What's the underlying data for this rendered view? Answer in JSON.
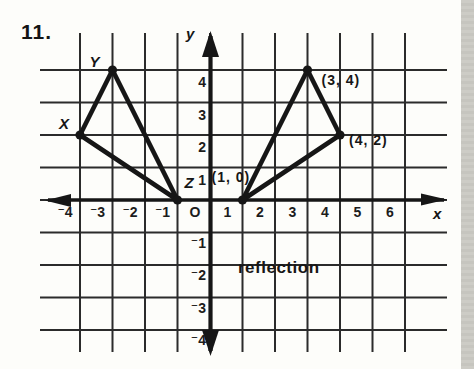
{
  "problem_number": "11.",
  "figure": {
    "x_axis_label": "x",
    "y_axis_label": "y",
    "annotation": "reflection",
    "x_ticks": [
      {
        "value": -4,
        "label": "⁻4"
      },
      {
        "value": -3,
        "label": "⁻3"
      },
      {
        "value": -2,
        "label": "⁻2"
      },
      {
        "value": -1,
        "label": "⁻1"
      },
      {
        "value": 0,
        "label": "O"
      },
      {
        "value": 1,
        "label": "1"
      },
      {
        "value": 2,
        "label": "2"
      },
      {
        "value": 3,
        "label": "3"
      },
      {
        "value": 4,
        "label": "4"
      },
      {
        "value": 5,
        "label": "5"
      },
      {
        "value": 6,
        "label": "6"
      }
    ],
    "y_ticks": [
      {
        "value": 4,
        "label": "4"
      },
      {
        "value": 3,
        "label": "3"
      },
      {
        "value": 2,
        "label": "2"
      },
      {
        "value": 1,
        "label": "1"
      },
      {
        "value": -1,
        "label": "⁻1"
      },
      {
        "value": -2,
        "label": "⁻2"
      },
      {
        "value": -3,
        "label": "⁻3"
      },
      {
        "value": -4,
        "label": "⁻4"
      }
    ]
  },
  "chart_data": {
    "type": "scatter",
    "xlim": [
      -4,
      6
    ],
    "ylim": [
      -4,
      4
    ],
    "grid": true,
    "annotation": "reflection",
    "series": [
      {
        "name": "triangle-xyz",
        "points": [
          {
            "label": "X",
            "x": -4,
            "y": 2
          },
          {
            "label": "Y",
            "x": -3,
            "y": 4
          },
          {
            "label": "Z",
            "x": -1,
            "y": 0
          }
        ]
      },
      {
        "name": "triangle-reflection",
        "points": [
          {
            "label": "(1, 0)",
            "x": 1,
            "y": 0
          },
          {
            "label": "(3, 4)",
            "x": 3,
            "y": 4
          },
          {
            "label": "(4, 2)",
            "x": 4,
            "y": 2
          }
        ]
      }
    ]
  },
  "ink_color": "#161616",
  "grid_line_color": "#2b2b2b",
  "page_edge_color": "#cbcac4"
}
